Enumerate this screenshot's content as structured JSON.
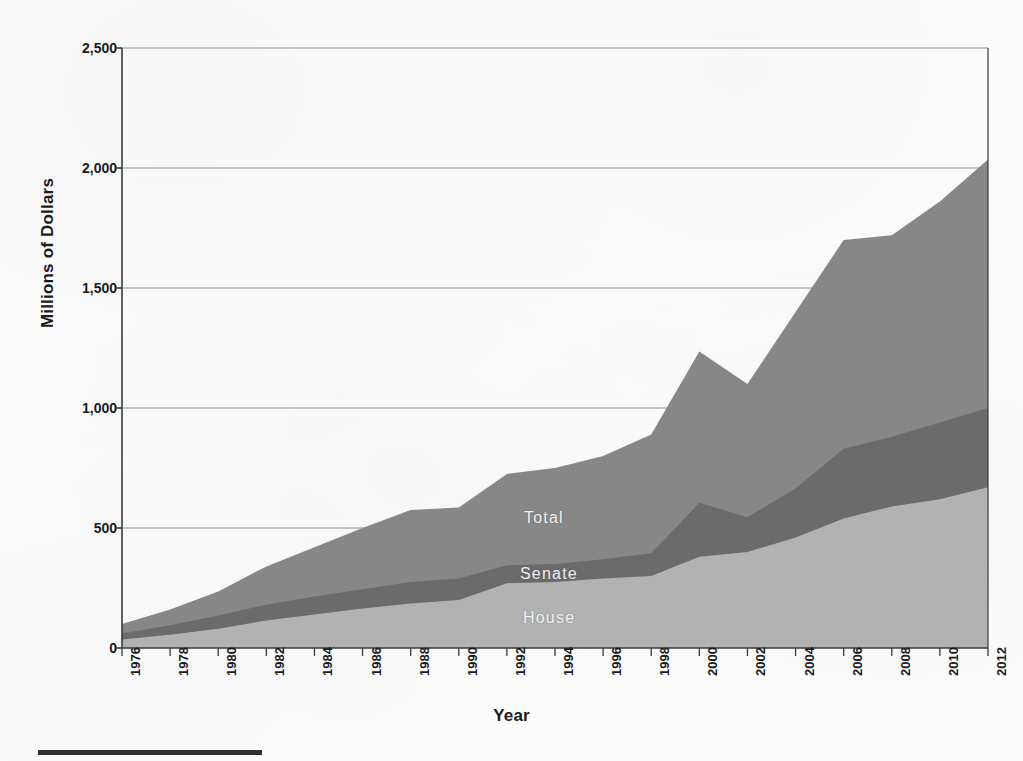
{
  "figure": {
    "background_color": "#fcfcfc",
    "axis_color": "#3a3a3a",
    "gridline_color": "#8f8f8f"
  },
  "axes": {
    "ylabel": "Millions of Dollars",
    "xlabel": "Year",
    "yticks": [
      "0",
      "500",
      "1,000",
      "1,500",
      "2,000",
      "2,500"
    ],
    "xticks": [
      "1976",
      "1978",
      "1980",
      "1982",
      "1984",
      "1986",
      "1988",
      "1990",
      "1992",
      "1994",
      "1996",
      "1998",
      "2000",
      "2002",
      "2004",
      "2006",
      "2008",
      "2010",
      "2012"
    ]
  },
  "series_labels": {
    "total": "Total",
    "senate": "Senate",
    "house": "House"
  },
  "colors": {
    "house": "#b2b2b2",
    "senate": "#6b6b6b",
    "total": "#878787"
  },
  "chart_data": {
    "type": "area",
    "title": "",
    "subtitle": "",
    "xlabel": "Year",
    "ylabel": "Millions of Dollars",
    "xlim": [
      1976,
      2012
    ],
    "ylim": [
      0,
      2500
    ],
    "ytick_values": [
      0,
      500,
      1000,
      1500,
      2000,
      2500
    ],
    "grid": "horizontal",
    "legend_position": "inline-labels",
    "stacked": false,
    "note": "Bands are cumulative boundaries: House is the lower band, Senate band top is House+Senate, Total band top is the overall Total.",
    "x": [
      1976,
      1978,
      1980,
      1982,
      1984,
      1986,
      1988,
      1990,
      1992,
      1994,
      1996,
      1998,
      2000,
      2002,
      2004,
      2006,
      2008,
      2010,
      2012
    ],
    "series": [
      {
        "name": "House",
        "color": "#b2b2b2",
        "values": [
          35,
          55,
          80,
          115,
          140,
          165,
          185,
          200,
          270,
          275,
          290,
          300,
          380,
          400,
          460,
          540,
          590,
          620,
          670
        ]
      },
      {
        "name": "Senate",
        "color": "#6b6b6b",
        "label_kind": "cumulative-top",
        "cumulative_top": [
          60,
          95,
          135,
          180,
          215,
          245,
          275,
          290,
          345,
          350,
          370,
          395,
          605,
          545,
          665,
          830,
          880,
          940,
          1000
        ],
        "values": [
          25,
          40,
          55,
          65,
          75,
          80,
          90,
          90,
          75,
          75,
          80,
          95,
          225,
          145,
          205,
          290,
          290,
          320,
          330
        ]
      },
      {
        "name": "Total",
        "color": "#878787",
        "label_kind": "cumulative-top",
        "cumulative_top": [
          100,
          160,
          235,
          340,
          420,
          500,
          575,
          585,
          725,
          750,
          800,
          890,
          1235,
          1100,
          1400,
          1700,
          1720,
          1860,
          2035
        ],
        "values": [
          100,
          160,
          235,
          340,
          420,
          500,
          575,
          585,
          725,
          750,
          800,
          890,
          1235,
          1100,
          1400,
          1700,
          1720,
          1860,
          2035
        ]
      }
    ]
  }
}
